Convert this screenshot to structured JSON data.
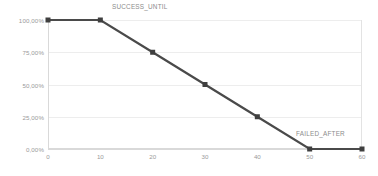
{
  "chart_data": {
    "type": "line",
    "title": "",
    "subtitle": "",
    "xlabel": "",
    "ylabel": "",
    "x": [
      0,
      10,
      20,
      30,
      40,
      50,
      60
    ],
    "values": [
      1.0,
      1.0,
      0.75,
      0.5,
      0.25,
      0.0,
      0.0
    ],
    "series": [
      {
        "name": "success_rate",
        "x": [
          0,
          10,
          20,
          30,
          40,
          50,
          60
        ],
        "values": [
          1.0,
          1.0,
          0.75,
          0.5,
          0.25,
          0.0,
          0.0
        ],
        "color": "#4a4a4a",
        "marker": "square"
      }
    ],
    "xlim": [
      0,
      60
    ],
    "ylim": [
      0,
      1.0
    ],
    "x_ticks": [
      0,
      10,
      20,
      30,
      40,
      50,
      60
    ],
    "x_tick_labels": [
      "0",
      "10",
      "20",
      "30",
      "40",
      "50",
      "60"
    ],
    "y_ticks": [
      0.0,
      0.25,
      0.5,
      0.75,
      1.0
    ],
    "y_tick_labels": [
      "0,00%",
      "25,00%",
      "50,00%",
      "75,00%",
      "100,00%"
    ],
    "grid": true,
    "legend": "none",
    "annotations": [
      {
        "id": "success-until",
        "text": "SUCCESS_UNTIL",
        "x": 10,
        "y": 1.0
      },
      {
        "id": "failed-after",
        "text": "FAILED_AFTER",
        "x": 50,
        "y": 0.0
      }
    ],
    "colors": {
      "line": "#4a4a4a",
      "marker": "#3f3f3f",
      "grid": "#ededed",
      "axis": "#d9d9d9",
      "tick_text": "#9a9a9a",
      "annotation_text": "#8c8c8c",
      "background": "#ffffff"
    }
  }
}
